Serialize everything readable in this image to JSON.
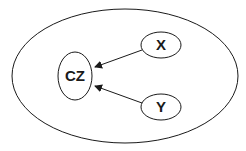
{
  "diagram": {
    "outer": {
      "cx": 125,
      "cy": 76,
      "rx": 113,
      "ry": 67
    },
    "nodes": [
      {
        "id": "cz",
        "label": "CZ",
        "cx": 75,
        "cy": 76,
        "rx": 17,
        "ry": 24
      },
      {
        "id": "x",
        "label": "X",
        "cx": 161,
        "cy": 45,
        "rx": 20,
        "ry": 13
      },
      {
        "id": "y",
        "label": "Y",
        "cx": 161,
        "cy": 107,
        "rx": 20,
        "ry": 13
      }
    ],
    "edges": [
      {
        "from": "X",
        "to": "CZ"
      },
      {
        "from": "Y",
        "to": "CZ"
      }
    ],
    "stroke_color": "#1a1a1a",
    "background": "#ffffff"
  }
}
